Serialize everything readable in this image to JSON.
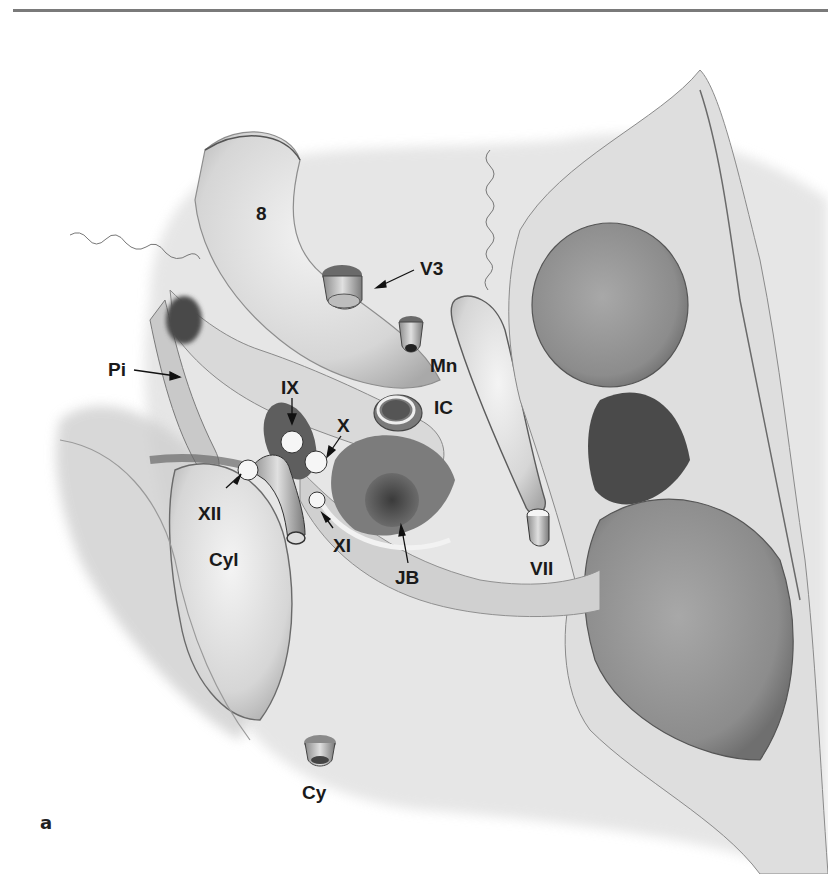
{
  "figure": {
    "panel_label": "a",
    "labels": {
      "eight": "8",
      "v3": "V3",
      "mn": "Mn",
      "ic": "IC",
      "pi": "Pi",
      "ix": "IX",
      "x": "X",
      "xii": "XII",
      "xi": "XI",
      "cyl": "Cyl",
      "jb": "JB",
      "vii": "VII",
      "cy": "Cy"
    }
  }
}
